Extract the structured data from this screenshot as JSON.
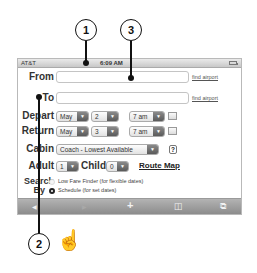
{
  "callouts": [
    {
      "number": "1",
      "target": "status-bar"
    },
    {
      "number": "3",
      "target": "from-field"
    },
    {
      "number": "2",
      "target": "page-scroll"
    }
  ],
  "status_bar": {
    "carrier": "AT&T",
    "signal_icon": "signal-bars-icon",
    "wifi_icon": "wifi-icon",
    "time": "6:09 AM",
    "battery_icon": "battery-icon"
  },
  "form": {
    "from_label": "From",
    "from_value": "",
    "from_link": "find airport",
    "to_label": "To",
    "to_value": "",
    "to_link": "find airport",
    "depart_label": "Depart",
    "depart_month": "May",
    "depart_day": "2",
    "depart_time": "7 am",
    "return_label": "Return",
    "return_month": "May",
    "return_day": "3",
    "return_time": "7 am",
    "cabin_label": "Cabin",
    "cabin_value": "Coach - Lowest Available",
    "help_label": "?",
    "adult_label": "Adult",
    "adult_value": "1",
    "child_label": "Child",
    "child_value": "0",
    "route_map_label": "Route Map",
    "search_by_label_1": "Search",
    "search_by_label_2": "By",
    "search_options": [
      {
        "label": "Low Fare Finder (for flexible dates)",
        "selected": false
      },
      {
        "label": "Schedule (for set dates)",
        "selected": true
      }
    ]
  },
  "toolbar": {
    "back": "◀",
    "forward": "▶",
    "add": "+",
    "bookmarks": "◫",
    "pages": "⧉"
  },
  "gesture_icon": "☝"
}
